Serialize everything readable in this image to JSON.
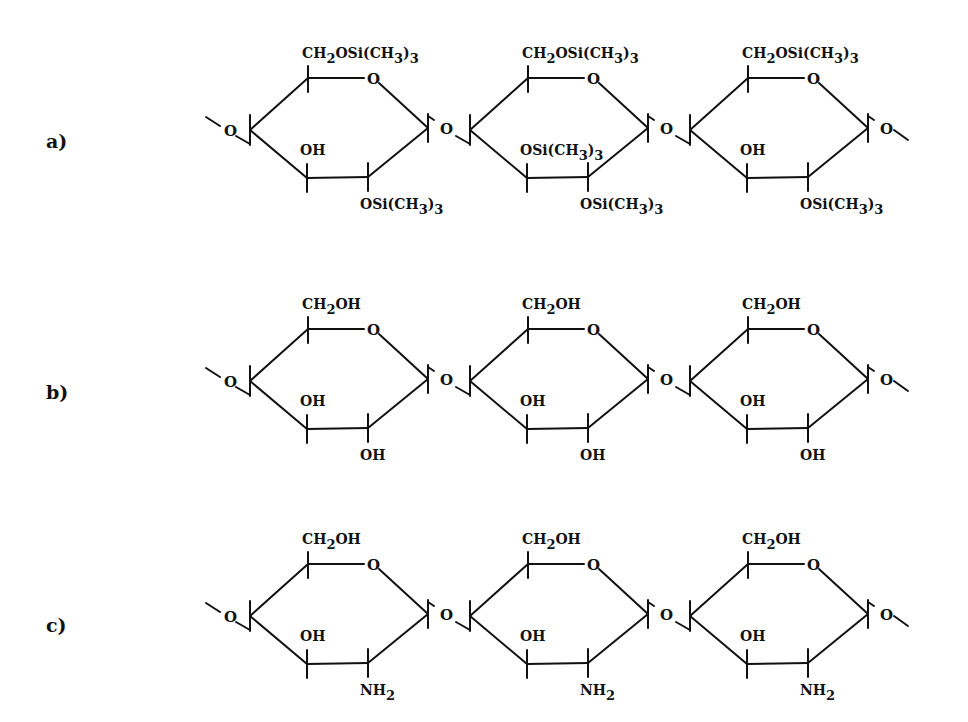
{
  "figure": {
    "rows": [
      {
        "label": "a)",
        "offset_y": 0,
        "units": [
          {
            "c6": "CH2OSi(CH3)3",
            "c3": "OH",
            "c2": "OSi(CH3)3"
          },
          {
            "c6": "CH2OSi(CH3)3",
            "c3": "OSi(CH3)3",
            "c2": "OSi(CH3)3"
          },
          {
            "c6": "CH2OSi(CH3)3",
            "c3": "OH",
            "c2": "OSi(CH3)3"
          }
        ]
      },
      {
        "label": "b)",
        "offset_y": 251,
        "units": [
          {
            "c6": "CH2OH",
            "c3": "OH",
            "c2": "OH"
          },
          {
            "c6": "CH2OH",
            "c3": "OH",
            "c2": "OH"
          },
          {
            "c6": "CH2OH",
            "c3": "OH",
            "c2": "OH"
          }
        ]
      },
      {
        "label": "c)",
        "offset_y": 486,
        "units": [
          {
            "c6": "CH2OH",
            "c3": "OH",
            "c2": "NH2"
          },
          {
            "c6": "CH2OH",
            "c3": "OH",
            "c2": "NH2"
          },
          {
            "c6": "CH2OH",
            "c3": "OH",
            "c2": "NH2"
          }
        ]
      }
    ],
    "ring_oxygen": "O",
    "glycosidic_oxygen": "O",
    "unit_spacing_x": 220
  }
}
